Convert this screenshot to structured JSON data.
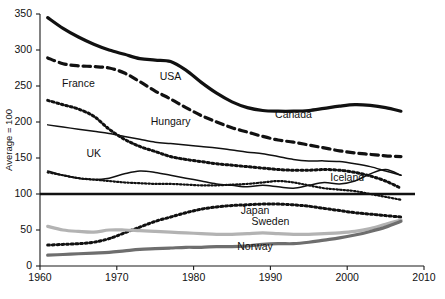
{
  "chart_data": {
    "type": "line",
    "title": "",
    "subtitle": "",
    "xlabel": "",
    "ylabel": "Average = 100",
    "xlim": [
      1960,
      2010
    ],
    "ylim": [
      0,
      350
    ],
    "xticks": [
      1960,
      1970,
      1980,
      1990,
      2000,
      2010
    ],
    "xtick_labels": [
      "1960",
      "1970",
      "1980",
      "1990",
      "2000",
      "2010"
    ],
    "yticks": [
      0,
      50,
      100,
      150,
      200,
      250,
      300,
      350
    ],
    "ytick_labels": [
      "0",
      "50",
      "100",
      "150",
      "200",
      "250",
      "300",
      "350"
    ],
    "grid": false,
    "legend_position": "inline-annotations",
    "reference_line": {
      "value": 100,
      "label": "Average = 100",
      "style": "solid",
      "color": "#111111"
    },
    "x": [
      1961,
      1963,
      1965,
      1967,
      1969,
      1971,
      1973,
      1975,
      1977,
      1979,
      1981,
      1983,
      1985,
      1987,
      1989,
      1991,
      1993,
      1995,
      1997,
      1999,
      2001,
      2003,
      2005,
      2007
    ],
    "series": [
      {
        "name": "USA",
        "style": "solid",
        "width": 3.2,
        "color": "#111111",
        "label_x": 1977,
        "label_y": 258,
        "values": [
          345,
          330,
          318,
          308,
          300,
          294,
          288,
          286,
          284,
          272,
          255,
          240,
          228,
          220,
          216,
          215,
          215,
          216,
          219,
          222,
          224,
          223,
          220,
          215
        ]
      },
      {
        "name": "Canada",
        "style": "dashed",
        "width": 3.2,
        "color": "#111111",
        "label_x": 1993,
        "label_y": 206,
        "values": [
          289,
          281,
          278,
          277,
          275,
          268,
          256,
          243,
          232,
          220,
          209,
          200,
          192,
          186,
          180,
          175,
          172,
          168,
          164,
          160,
          157,
          155,
          153,
          152
        ]
      },
      {
        "name": "Hungary",
        "style": "dotted",
        "width": 3.0,
        "color": "#111111",
        "label_x": 1977,
        "label_y": 196,
        "values": [
          230,
          224,
          218,
          208,
          190,
          176,
          166,
          159,
          152,
          148,
          145,
          142,
          140,
          138,
          136,
          134,
          133,
          133,
          134,
          133,
          130,
          125,
          118,
          108
        ]
      },
      {
        "name": "France",
        "style": "solid",
        "width": 1.5,
        "color": "#111111",
        "label_x": 1965,
        "label_y": 248,
        "values": [
          196,
          193,
          190,
          187,
          184,
          180,
          176,
          172,
          170,
          168,
          166,
          164,
          161,
          158,
          156,
          152,
          148,
          146,
          146,
          145,
          142,
          138,
          132,
          126
        ]
      },
      {
        "name": "UK",
        "style": "solid",
        "width": 1.5,
        "color": "#111111",
        "label_x": 1967,
        "label_y": 152,
        "values": [
          132,
          126,
          122,
          120,
          122,
          128,
          132,
          130,
          126,
          122,
          118,
          114,
          112,
          110,
          112,
          110,
          108,
          112,
          116,
          114,
          118,
          128,
          134,
          126
        ]
      },
      {
        "name": "Iceland",
        "style": "dotted",
        "width": 2.2,
        "color": "#111111",
        "label_x": 2000,
        "label_y": 118,
        "values": [
          130,
          126,
          122,
          120,
          118,
          116,
          115,
          114,
          114,
          113,
          112,
          112,
          113,
          114,
          116,
          118,
          116,
          112,
          108,
          106,
          104,
          100,
          96,
          92
        ]
      },
      {
        "name": "Japan",
        "style": "dotted",
        "width": 3.0,
        "color": "#111111",
        "label_x": 1988,
        "label_y": 72,
        "values": [
          29,
          30,
          31,
          33,
          38,
          46,
          54,
          62,
          68,
          74,
          79,
          82,
          84,
          85,
          86,
          86,
          85,
          83,
          80,
          77,
          74,
          72,
          70,
          68
        ]
      },
      {
        "name": "Sweden",
        "style": "solid",
        "width": 3.2,
        "color": "#b3b3b3",
        "label_x": 1990,
        "label_y": 57,
        "values": [
          55,
          50,
          48,
          47,
          50,
          50,
          49,
          48,
          47,
          46,
          45,
          44,
          44,
          45,
          46,
          45,
          44,
          44,
          45,
          46,
          48,
          52,
          58,
          64
        ]
      },
      {
        "name": "Norway",
        "style": "solid",
        "width": 3.2,
        "color": "#6e6e6e",
        "label_x": 1988,
        "label_y": 22,
        "values": [
          15,
          16,
          17,
          18,
          19,
          21,
          23,
          24,
          25,
          26,
          26,
          27,
          27,
          28,
          30,
          31,
          31,
          33,
          36,
          39,
          43,
          48,
          54,
          62
        ]
      }
    ]
  }
}
